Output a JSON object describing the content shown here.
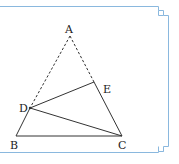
{
  "diagram": {
    "type": "geometry-triangle",
    "frame_color": "#8ab8de",
    "line_color": "#333333",
    "points": {
      "A": {
        "label": "A",
        "x": 70,
        "y": 36
      },
      "B": {
        "label": "B",
        "x": 16,
        "y": 136
      },
      "C": {
        "label": "C",
        "x": 122,
        "y": 136
      },
      "D": {
        "label": "D",
        "x": 30,
        "y": 108
      },
      "E": {
        "label": "E",
        "x": 94,
        "y": 82
      }
    },
    "segments": [
      {
        "from": "A",
        "to": "D",
        "style": "dashed"
      },
      {
        "from": "A",
        "to": "E",
        "style": "dashed"
      },
      {
        "from": "D",
        "to": "B",
        "style": "solid"
      },
      {
        "from": "B",
        "to": "C",
        "style": "solid"
      },
      {
        "from": "E",
        "to": "C",
        "style": "solid"
      },
      {
        "from": "D",
        "to": "E",
        "style": "solid"
      },
      {
        "from": "D",
        "to": "C",
        "style": "solid"
      }
    ]
  }
}
